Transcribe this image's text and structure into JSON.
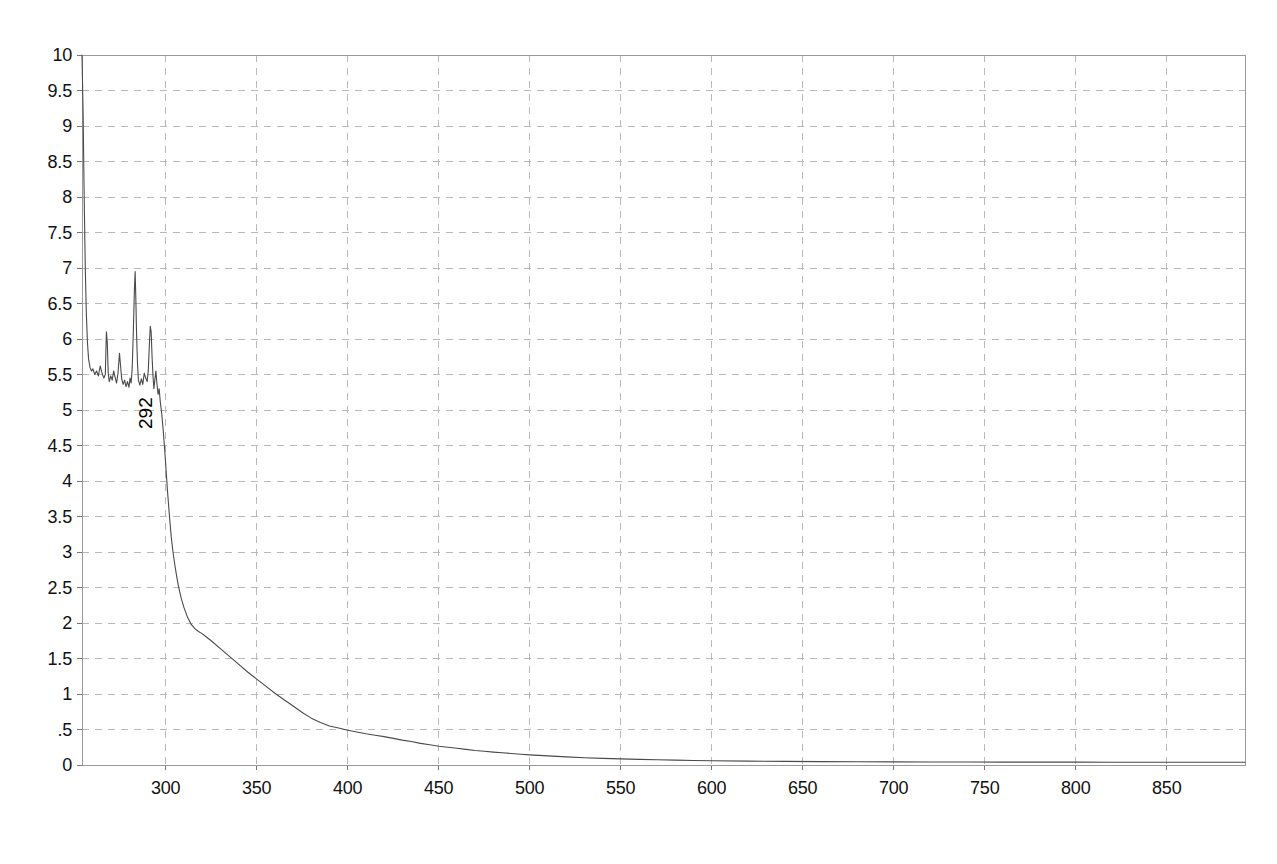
{
  "chart_data": {
    "type": "line",
    "title": "",
    "subtitle": "",
    "xlabel": "",
    "ylabel": "",
    "xlim": [
      254,
      893
    ],
    "ylim": [
      0,
      10
    ],
    "grid": true,
    "legend": null,
    "legend_position": "none",
    "x_ticks": [
      300,
      350,
      400,
      450,
      500,
      550,
      600,
      650,
      700,
      750,
      800,
      850
    ],
    "x_tick_labels": [
      "300",
      "350",
      "400",
      "450",
      "500",
      "550",
      "600",
      "650",
      "700",
      "750",
      "800",
      "850"
    ],
    "y_ticks": [
      0,
      0.5,
      1,
      1.5,
      2,
      2.5,
      3,
      3.5,
      4,
      4.5,
      5,
      5.5,
      6,
      6.5,
      7,
      7.5,
      8,
      8.5,
      9,
      9.5,
      10
    ],
    "y_tick_labels": [
      "0",
      ".5",
      "1",
      "1.5",
      "2",
      "2.5",
      "3",
      "3.5",
      "4",
      "4.5",
      "5",
      "5.5",
      "6",
      "6.5",
      "7",
      "7.5",
      "8",
      "8.5",
      "9",
      "9.5",
      "10"
    ],
    "line_color": "#4a4a4a",
    "grid_color": "#b9b9b9",
    "axis_color": "#9a9a9a",
    "annotations": [
      {
        "label": "292",
        "x": 292,
        "y": 5.55,
        "rotation": -90
      }
    ],
    "series": [
      {
        "name": "absorbance",
        "points": [
          [
            254.0,
            10.0
          ],
          [
            254.6,
            9.2
          ],
          [
            255.2,
            8.0
          ],
          [
            255.8,
            7.0
          ],
          [
            256.4,
            6.35
          ],
          [
            257.0,
            5.95
          ],
          [
            257.6,
            5.72
          ],
          [
            258.4,
            5.6
          ],
          [
            259.2,
            5.55
          ],
          [
            260.0,
            5.58
          ],
          [
            261.0,
            5.5
          ],
          [
            262.0,
            5.55
          ],
          [
            263.0,
            5.48
          ],
          [
            264.0,
            5.62
          ],
          [
            265.0,
            5.52
          ],
          [
            266.0,
            5.45
          ],
          [
            266.8,
            5.5
          ],
          [
            267.4,
            6.1
          ],
          [
            267.9,
            5.95
          ],
          [
            268.4,
            5.52
          ],
          [
            269.0,
            5.4
          ],
          [
            269.8,
            5.48
          ],
          [
            270.6,
            5.42
          ],
          [
            271.4,
            5.55
          ],
          [
            272.2,
            5.46
          ],
          [
            273.0,
            5.38
          ],
          [
            273.8,
            5.52
          ],
          [
            274.6,
            5.8
          ],
          [
            275.2,
            5.62
          ],
          [
            275.8,
            5.44
          ],
          [
            276.6,
            5.36
          ],
          [
            277.4,
            5.42
          ],
          [
            278.2,
            5.33
          ],
          [
            279.0,
            5.4
          ],
          [
            279.8,
            5.32
          ],
          [
            280.4,
            5.45
          ],
          [
            281.0,
            5.38
          ],
          [
            281.6,
            5.6
          ],
          [
            282.2,
            6.1
          ],
          [
            282.8,
            6.7
          ],
          [
            283.2,
            6.95
          ],
          [
            283.6,
            6.55
          ],
          [
            284.0,
            6.05
          ],
          [
            284.5,
            5.65
          ],
          [
            285.0,
            5.42
          ],
          [
            285.8,
            5.35
          ],
          [
            286.6,
            5.44
          ],
          [
            287.4,
            5.36
          ],
          [
            288.2,
            5.52
          ],
          [
            289.0,
            5.45
          ],
          [
            289.8,
            5.4
          ],
          [
            290.4,
            5.55
          ],
          [
            291.0,
            5.9
          ],
          [
            291.5,
            6.18
          ],
          [
            292.0,
            6.1
          ],
          [
            292.5,
            5.75
          ],
          [
            293.0,
            5.48
          ],
          [
            293.5,
            5.3
          ],
          [
            294.0,
            5.42
          ],
          [
            294.6,
            5.55
          ],
          [
            295.2,
            5.36
          ],
          [
            295.8,
            5.22
          ],
          [
            296.4,
            5.3
          ],
          [
            297.0,
            5.12
          ],
          [
            297.8,
            4.95
          ],
          [
            298.6,
            4.72
          ],
          [
            299.4,
            4.45
          ],
          [
            300.2,
            4.15
          ],
          [
            301.0,
            3.85
          ],
          [
            302.0,
            3.52
          ],
          [
            303.0,
            3.22
          ],
          [
            304.0,
            3.0
          ],
          [
            305.0,
            2.82
          ],
          [
            306.0,
            2.66
          ],
          [
            307.0,
            2.52
          ],
          [
            308.5,
            2.35
          ],
          [
            310.0,
            2.22
          ],
          [
            312.0,
            2.08
          ],
          [
            314.0,
            1.98
          ],
          [
            316.0,
            1.92
          ],
          [
            318.0,
            1.88
          ],
          [
            320.0,
            1.85
          ],
          [
            322.0,
            1.81
          ],
          [
            325.0,
            1.75
          ],
          [
            330.0,
            1.64
          ],
          [
            335.0,
            1.53
          ],
          [
            340.0,
            1.42
          ],
          [
            345.0,
            1.31
          ],
          [
            350.0,
            1.21
          ],
          [
            355.0,
            1.11
          ],
          [
            360.0,
            1.01
          ],
          [
            365.0,
            0.92
          ],
          [
            370.0,
            0.83
          ],
          [
            375.0,
            0.74
          ],
          [
            380.0,
            0.66
          ],
          [
            385.0,
            0.6
          ],
          [
            390.0,
            0.55
          ],
          [
            395.0,
            0.52
          ],
          [
            400.0,
            0.49
          ],
          [
            405.0,
            0.465
          ],
          [
            410.0,
            0.44
          ],
          [
            415.0,
            0.42
          ],
          [
            420.0,
            0.4
          ],
          [
            425.0,
            0.375
          ],
          [
            430.0,
            0.35
          ],
          [
            435.0,
            0.33
          ],
          [
            440.0,
            0.305
          ],
          [
            445.0,
            0.285
          ],
          [
            450.0,
            0.265
          ],
          [
            455.0,
            0.25
          ],
          [
            460.0,
            0.235
          ],
          [
            465.0,
            0.22
          ],
          [
            470.0,
            0.205
          ],
          [
            475.0,
            0.193
          ],
          [
            480.0,
            0.182
          ],
          [
            485.0,
            0.172
          ],
          [
            490.0,
            0.162
          ],
          [
            495.0,
            0.152
          ],
          [
            500.0,
            0.143
          ],
          [
            510.0,
            0.128
          ],
          [
            520.0,
            0.115
          ],
          [
            530.0,
            0.103
          ],
          [
            540.0,
            0.094
          ],
          [
            550.0,
            0.086
          ],
          [
            560.0,
            0.079
          ],
          [
            570.0,
            0.073
          ],
          [
            580.0,
            0.068
          ],
          [
            590.0,
            0.064
          ],
          [
            600.0,
            0.06
          ],
          [
            620.0,
            0.055
          ],
          [
            640.0,
            0.051
          ],
          [
            660.0,
            0.048
          ],
          [
            680.0,
            0.046
          ],
          [
            700.0,
            0.044
          ],
          [
            720.0,
            0.043
          ],
          [
            740.0,
            0.042
          ],
          [
            760.0,
            0.041
          ],
          [
            780.0,
            0.04
          ],
          [
            800.0,
            0.04
          ],
          [
            820.0,
            0.039
          ],
          [
            840.0,
            0.039
          ],
          [
            860.0,
            0.038
          ],
          [
            880.0,
            0.038
          ],
          [
            893.0,
            0.038
          ]
        ]
      }
    ]
  },
  "plot_geometry": {
    "left": 82,
    "right": 1245,
    "top": 55,
    "bottom": 765
  }
}
